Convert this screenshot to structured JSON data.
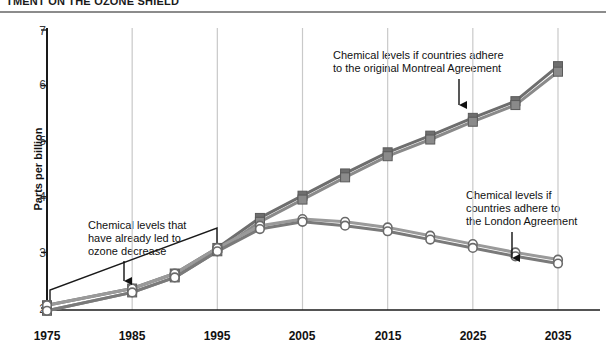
{
  "title": "TMENT ON THE OZONE SHIELD",
  "chart_data": {
    "type": "line",
    "title": "TMENT ON THE OZONE SHIELD",
    "xlabel": "",
    "ylabel": "Parts per billion",
    "xlim": [
      1975,
      2035
    ],
    "ylim": [
      2,
      7
    ],
    "yticks": [
      2,
      3,
      4,
      5,
      6,
      7
    ],
    "xticks": [
      1975,
      1985,
      1995,
      2005,
      2015,
      2025,
      2035
    ],
    "grid": "vertical",
    "legend": "none",
    "x": [
      1975,
      1985,
      1990,
      1995,
      2000,
      2005,
      2010,
      2015,
      2020,
      2025,
      2030,
      2035
    ],
    "series": [
      {
        "name": "Montreal Agreement (upper)",
        "marker": "square",
        "color": "#6e6e6e",
        "values": [
          2.05,
          2.35,
          2.62,
          3.08,
          3.62,
          4.02,
          4.42,
          4.8,
          5.1,
          5.42,
          5.72,
          6.35
        ]
      },
      {
        "name": "Montreal Agreement (lower)",
        "marker": "square",
        "color": "#8a8a8a",
        "values": [
          1.95,
          2.28,
          2.55,
          3.02,
          3.55,
          3.95,
          4.35,
          4.73,
          5.03,
          5.35,
          5.65,
          6.25
        ]
      },
      {
        "name": "London Agreement (upper)",
        "marker": "circle",
        "color": "#9a9a9a",
        "values": [
          2.05,
          2.35,
          2.62,
          3.08,
          3.48,
          3.6,
          3.55,
          3.45,
          3.3,
          3.15,
          3.0,
          2.87
        ]
      },
      {
        "name": "London Agreement (lower)",
        "marker": "circle",
        "color": "#7a7a7a",
        "values": [
          1.95,
          2.28,
          2.55,
          3.02,
          3.42,
          3.55,
          3.48,
          3.38,
          3.23,
          3.08,
          2.93,
          2.8
        ]
      }
    ],
    "annotations": [
      {
        "id": "already-led",
        "text": "Chemical levels that\nhave already led to\nozone decrease",
        "arrow": "down"
      },
      {
        "id": "montreal",
        "text": "Chemical levels if countries adhere\nto the  original Montreal Agreement",
        "arrow": "down"
      },
      {
        "id": "london",
        "text": "Chemical levels if\ncountries adhere to\nthe London Agreement",
        "arrow": "down"
      }
    ],
    "shapes": [
      {
        "id": "historic-bracket",
        "type": "open-parallelogram",
        "note": "outline enclosing the 1975-1995 historic segment"
      }
    ]
  },
  "axis": {
    "ylabel": "Parts per billion",
    "yticks": [
      "7",
      "6",
      "5",
      "4",
      "3",
      "2"
    ],
    "xticks": [
      "1975",
      "1985",
      "1995",
      "2005",
      "2015",
      "2025",
      "2035"
    ]
  },
  "colors": {
    "axis": "#1a1a1a",
    "grid": "#c9c9c9",
    "montreal": "#6e6e6e",
    "london": "#8f8f8f",
    "rule": "#8c8c8c",
    "text": "#111111"
  }
}
